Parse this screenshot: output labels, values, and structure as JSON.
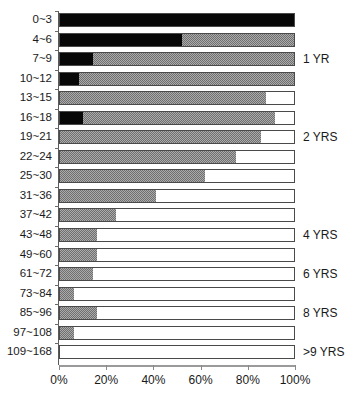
{
  "chart": {
    "type": "bar",
    "title": "",
    "xlabel": "",
    "ylabel": ""
  },
  "axis": {
    "x_ticks": [
      "0%",
      "20%",
      "40%",
      "60%",
      "80%",
      "100%"
    ],
    "x_tick_values": [
      0,
      20,
      40,
      60,
      80,
      100
    ],
    "x_min": 0,
    "x_max": 100
  },
  "annotations": [
    {
      "label": "1 YR",
      "row_index": 3
    },
    {
      "label": "2 YRS",
      "row_index": 7
    },
    {
      "label": "4 YRS",
      "row_index": 12
    },
    {
      "label": "6 YRS",
      "row_index": 14
    },
    {
      "label": "8 YRS",
      "row_index": 16
    },
    {
      "label": ">9 YRS",
      "row_index": 18
    }
  ],
  "chart_data": {
    "type": "bar",
    "orientation": "horizontal",
    "stacked": true,
    "title": "",
    "xlabel": "",
    "ylabel": "",
    "xlim": [
      0,
      100
    ],
    "grid": false,
    "legend": null,
    "categories": [
      "0~3",
      "4~6",
      "7~9",
      "10~12",
      "13~15",
      "16~18",
      "19~21",
      "22~24",
      "25~30",
      "31~36",
      "37~42",
      "43~48",
      "49~60",
      "61~72",
      "73~84",
      "85~96",
      "97~108",
      "109~168"
    ],
    "series": [
      {
        "name": "black",
        "color": "#080808",
        "values": [
          100,
          52,
          14,
          8,
          0,
          10,
          0,
          0,
          0,
          0,
          0,
          0,
          0,
          0,
          0,
          0,
          0,
          0
        ]
      },
      {
        "name": "gray",
        "color": "#6f6f6f",
        "values": [
          0,
          48,
          86,
          92,
          88,
          82,
          86,
          75,
          62,
          41,
          24,
          16,
          16,
          14,
          6,
          16,
          6,
          0
        ]
      },
      {
        "name": "white",
        "color": "#ffffff",
        "values": [
          0,
          0,
          0,
          0,
          12,
          8,
          14,
          25,
          38,
          59,
          76,
          84,
          84,
          86,
          94,
          84,
          94,
          100
        ]
      }
    ]
  }
}
